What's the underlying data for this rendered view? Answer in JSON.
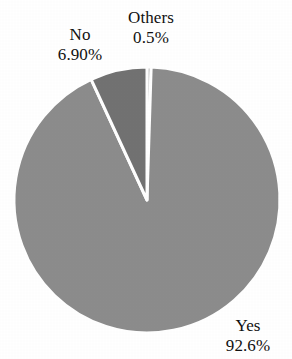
{
  "chart_data": {
    "type": "pie",
    "title": "",
    "subtitle": "",
    "xlabel": "",
    "ylabel": "",
    "legend_position": "none",
    "grid": false,
    "categories": [
      "Others",
      "Yes",
      "No"
    ],
    "values": [
      0.5,
      92.6,
      6.9
    ],
    "slices": [
      {
        "name": "Others",
        "value": 0.5,
        "value_label": "0.5%",
        "color": "#8c8c8c",
        "start_angle_deg": 0,
        "end_angle_deg": 1.8,
        "label_position": "top-center"
      },
      {
        "name": "Yes",
        "value": 92.6,
        "value_label": "92.6%",
        "color": "#8c8c8c",
        "start_angle_deg": 1.8,
        "end_angle_deg": 335.16,
        "label_position": "bottom-right"
      },
      {
        "name": "No",
        "value": 6.9,
        "value_label": "6.90%",
        "color": "#727272",
        "start_angle_deg": 335.16,
        "end_angle_deg": 360,
        "label_position": "upper-left"
      }
    ]
  },
  "geometry": {
    "center_x": 147,
    "center_y": 200,
    "radius": 133,
    "separator_color": "#ffffff",
    "separator_width": 3,
    "background": "#ffffff"
  },
  "labels": {
    "no": {
      "name": "No",
      "value": "6.90%"
    },
    "others": {
      "name": "Others",
      "value": "0.5%"
    },
    "yes": {
      "name": "Yes",
      "value": "92.6%"
    }
  }
}
